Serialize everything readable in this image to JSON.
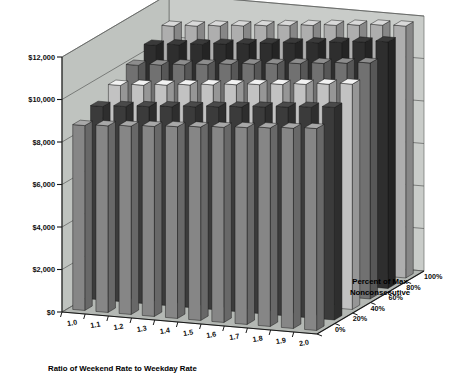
{
  "chart_data": {
    "type": "bar",
    "title": "",
    "subtitle": "",
    "xlabel": "Ratio of Weekend Rate to Weekday Rate",
    "ylabel": "",
    "zlabel": "Percent of Max Nonconsecutive",
    "ylim": [
      0,
      12000
    ],
    "yticks": [
      0,
      2000,
      4000,
      6000,
      8000,
      10000,
      12000
    ],
    "ytick_labels": [
      "$0",
      "$2,000",
      "$4,000",
      "$6,000",
      "$8,000",
      "$10,000",
      "$12,000"
    ],
    "categories": [
      "1.0",
      "1.1",
      "1.2",
      "1.3",
      "1.4",
      "1.5",
      "1.6",
      "1.7",
      "1.8",
      "1.9",
      "2.0"
    ],
    "depth_categories": [
      "0%",
      "20%",
      "40%",
      "60%",
      "80%",
      "100%"
    ],
    "grid": true,
    "legend": "none",
    "projection": "3d-isometric",
    "series": [
      {
        "name": "0%",
        "color": "#a8a8a8",
        "values": [
          8700,
          8780,
          8860,
          8940,
          9020,
          9100,
          9180,
          9260,
          9340,
          9420,
          9500
        ]
      },
      {
        "name": "20%",
        "color": "#4a4a4a",
        "values": [
          9100,
          9190,
          9280,
          9370,
          9460,
          9550,
          9640,
          9730,
          9820,
          9910,
          10000
        ]
      },
      {
        "name": "40%",
        "color": "#f2f2f2",
        "values": [
          9600,
          9700,
          9800,
          9900,
          10000,
          10100,
          10200,
          10300,
          10400,
          10500,
          10600
        ]
      },
      {
        "name": "60%",
        "color": "#8d8d8d",
        "values": [
          10050,
          10155,
          10260,
          10365,
          10470,
          10575,
          10680,
          10785,
          10890,
          10995,
          11100
        ]
      },
      {
        "name": "80%",
        "color": "#3a3a3a",
        "values": [
          10500,
          10610,
          10720,
          10830,
          10940,
          11050,
          11160,
          11270,
          11380,
          11490,
          11600
        ]
      },
      {
        "name": "100%",
        "color": "#d9d9d9",
        "values": [
          10900,
          11000,
          11100,
          11200,
          11300,
          11400,
          11500,
          11600,
          11700,
          11800,
          11850
        ]
      }
    ]
  },
  "axes": {
    "x_axis_title": "Ratio of Weekend Rate to Weekday Rate",
    "z_axis_title_line1": "Percent of Max",
    "z_axis_title_line2": "Nonconsecutive"
  },
  "colors": {
    "back_wall": "#c9ccc9",
    "side_wall": "#bfc3bf",
    "floor": "#b4b8b4",
    "gridline": "#5a5c5a",
    "axis": "#1a1a1a",
    "text": "#0d0d0d"
  }
}
